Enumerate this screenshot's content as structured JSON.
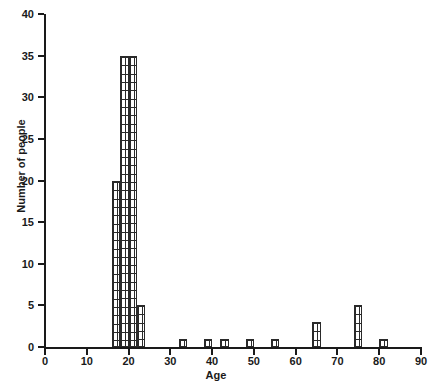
{
  "chart_data": {
    "type": "bar",
    "title": "",
    "subtitle": "",
    "xlabel": "Age",
    "ylabel": "Number of people",
    "xlim": [
      0,
      90
    ],
    "ylim": [
      0,
      40
    ],
    "grid": false,
    "legend": null,
    "bin_width": 2,
    "xticks": [
      0,
      10,
      20,
      30,
      40,
      50,
      60,
      70,
      80,
      90
    ],
    "xtick_labels": [
      "0",
      "10",
      "20",
      "30",
      "40",
      "50",
      "60",
      "70",
      "80",
      "90"
    ],
    "yticks": [
      0,
      5,
      10,
      15,
      20,
      25,
      30,
      35,
      40
    ],
    "ytick_labels": [
      "0",
      "5",
      "10",
      "15",
      "20",
      "25",
      "30",
      "35",
      "40"
    ],
    "bars": [
      {
        "bin_start": 16,
        "bin_end": 18,
        "value": 20
      },
      {
        "bin_start": 18,
        "bin_end": 20,
        "value": 35
      },
      {
        "bin_start": 20,
        "bin_end": 22,
        "value": 35
      },
      {
        "bin_start": 22,
        "bin_end": 24,
        "value": 5
      },
      {
        "bin_start": 32,
        "bin_end": 34,
        "value": 1
      },
      {
        "bin_start": 38,
        "bin_end": 40,
        "value": 1
      },
      {
        "bin_start": 42,
        "bin_end": 44,
        "value": 1
      },
      {
        "bin_start": 48,
        "bin_end": 50,
        "value": 1
      },
      {
        "bin_start": 54,
        "bin_end": 56,
        "value": 1
      },
      {
        "bin_start": 64,
        "bin_end": 66,
        "value": 3
      },
      {
        "bin_start": 74,
        "bin_end": 76,
        "value": 5
      },
      {
        "bin_start": 80,
        "bin_end": 82,
        "value": 1
      }
    ],
    "categories": [
      "16-18",
      "18-20",
      "20-22",
      "22-24",
      "32-34",
      "38-40",
      "42-44",
      "48-50",
      "54-56",
      "64-66",
      "74-76",
      "80-82"
    ],
    "values": [
      20,
      35,
      35,
      5,
      1,
      1,
      1,
      1,
      1,
      3,
      5,
      1
    ],
    "colors": {
      "axis": "#1a1a1a",
      "bar_outline": "#2a2a2a",
      "bar_fill": "#ffffff",
      "background": "#ffffff"
    }
  }
}
